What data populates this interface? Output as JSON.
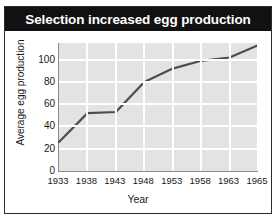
{
  "chart_data": {
    "type": "line",
    "title": "Selection increased egg production",
    "xlabel": "Year",
    "ylabel": "Average egg production",
    "x": [
      1933,
      1938,
      1943,
      1948,
      1953,
      1958,
      1963,
      1965
    ],
    "values": [
      26,
      52,
      53,
      80,
      92,
      99,
      102,
      113
    ],
    "series": [
      {
        "name": "Average egg production",
        "values": [
          26,
          52,
          53,
          80,
          92,
          99,
          102,
          113
        ]
      }
    ],
    "xtick_labels": [
      "1933",
      "1938",
      "1943",
      "1948",
      "1953",
      "1958",
      "1963",
      "1965"
    ],
    "ytick_labels": [
      "0",
      "20",
      "40",
      "60",
      "80",
      "100"
    ],
    "ytick_values": [
      0,
      20,
      40,
      60,
      80,
      100
    ],
    "ylim": [
      0,
      115
    ],
    "xlim": [
      1933,
      1965
    ],
    "grid": true,
    "legend": "none",
    "colors": {
      "title_bar": "#111111",
      "title_text": "#ffffff",
      "plot_background": "#e3e3e3",
      "gridline": "#ffffff",
      "line": "#4d4d4d",
      "axis": "#8d8d8d",
      "figure_border": "#2b2b2b"
    }
  }
}
